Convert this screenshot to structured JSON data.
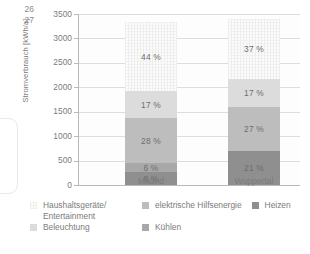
{
  "page_numbers": [
    "26",
    "27"
  ],
  "chart_data": {
    "type": "bar",
    "stacked": true,
    "title": "",
    "xlabel": "",
    "ylabel": "Stromverbrauch [kWh/a]",
    "ylim": [
      0,
      3500
    ],
    "yticks": [
      "0",
      "500",
      "1000",
      "1500",
      "2000",
      "2500",
      "3000",
      "3500"
    ],
    "grid": true,
    "legend_position": "bottom",
    "categories": [
      "Madrid",
      "Wuppertal"
    ],
    "series": [
      {
        "name": "Heizen",
        "color": "#8f8f8f",
        "values": [
          260,
          700
        ],
        "labels": [
          "8 %",
          "21 %"
        ]
      },
      {
        "name": "Kühlen",
        "color": "#a8a8a8",
        "values": [
          195,
          0
        ],
        "labels": [
          "6 %",
          ""
        ]
      },
      {
        "name": "elektrische Hilfsenergie",
        "color": "#bdbdbd",
        "values": [
          910,
          900
        ],
        "labels": [
          "28 %",
          "27 %"
        ]
      },
      {
        "name": "Beleuchtung",
        "color": "#dcdcdc",
        "values": [
          550,
          565
        ],
        "labels": [
          "17 %",
          "17 %"
        ]
      },
      {
        "name": "Haushaltsgeräte/\nEntertainment",
        "color": "#fcfcfc",
        "values": [
          1430,
          1230
        ],
        "labels": [
          "44 %",
          "37 %"
        ]
      }
    ],
    "totals": [
      3345,
      3395
    ]
  },
  "legend": {
    "items": [
      {
        "label": "Haushaltsgeräte/\nEntertainment",
        "swatch": "haushalt"
      },
      {
        "label": "elektrische Hilfsenergie",
        "swatch": "hilfsenergie"
      },
      {
        "label": "Heizen",
        "swatch": "heizen"
      },
      {
        "label": "Beleuchtung",
        "swatch": "beleuchtung"
      },
      {
        "label": "Kühlen",
        "swatch": "kuehlen"
      }
    ]
  }
}
